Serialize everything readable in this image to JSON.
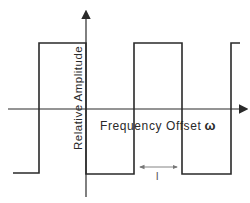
{
  "diagram": {
    "type": "square-wave",
    "x_axis": {
      "label": "Frequency Offset",
      "symbol": "ω"
    },
    "y_axis": {
      "label": "Relative Amplitude"
    },
    "interval_marker": {
      "label": "l"
    },
    "colors": {
      "line": "#2a2a2a",
      "marker": "#777777",
      "background": "#ffffff"
    }
  }
}
